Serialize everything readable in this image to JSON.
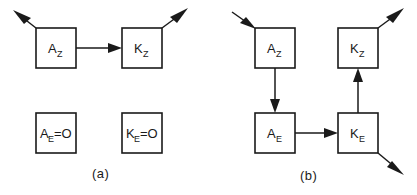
{
  "figure": {
    "type": "block-diagram",
    "panels": [
      {
        "id": "a",
        "caption": "(a)",
        "nodes": [
          {
            "id": "a-az",
            "base": "A",
            "sub": "Z",
            "text": "A",
            "x": 36,
            "y": 28,
            "w": 40,
            "h": 40
          },
          {
            "id": "a-kz",
            "base": "K",
            "sub": "Z",
            "text": "K",
            "x": 122,
            "y": 28,
            "w": 40,
            "h": 40
          },
          {
            "id": "a-ae",
            "base": "A",
            "sub": "E",
            "suffix": "=O",
            "text": "A",
            "x": 36,
            "y": 113,
            "w": 40,
            "h": 40
          },
          {
            "id": "a-ke",
            "base": "K",
            "sub": "E",
            "suffix": " =O",
            "text": "K",
            "x": 122,
            "y": 113,
            "w": 40,
            "h": 40
          }
        ],
        "edges": [
          {
            "id": "a-in-az",
            "from": "external",
            "to": "a-az",
            "kind": "diagonal-up-left"
          },
          {
            "id": "a-az-kz",
            "from": "a-az",
            "to": "a-kz",
            "kind": "horizontal-right"
          },
          {
            "id": "a-kz-out",
            "from": "a-kz",
            "to": "external",
            "kind": "diagonal-up-right"
          }
        ]
      },
      {
        "id": "b",
        "caption": "(b)",
        "nodes": [
          {
            "id": "b-az",
            "base": "A",
            "sub": "Z",
            "text": "A",
            "x": 255,
            "y": 28,
            "w": 40,
            "h": 40
          },
          {
            "id": "b-kz",
            "base": "K",
            "sub": "Z",
            "text": "K",
            "x": 338,
            "y": 28,
            "w": 40,
            "h": 40
          },
          {
            "id": "b-ae",
            "base": "A",
            "sub": "E",
            "text": "A",
            "x": 255,
            "y": 113,
            "w": 40,
            "h": 40
          },
          {
            "id": "b-ke",
            "base": "K",
            "sub": "E",
            "text": "K",
            "x": 338,
            "y": 113,
            "w": 40,
            "h": 40
          }
        ],
        "edges": [
          {
            "id": "b-in-az",
            "from": "external",
            "to": "b-az",
            "kind": "diagonal-down-right"
          },
          {
            "id": "b-az-ae",
            "from": "b-az",
            "to": "b-ae",
            "kind": "vertical-down"
          },
          {
            "id": "b-ae-ke",
            "from": "b-ae",
            "to": "b-ke",
            "kind": "horizontal-right"
          },
          {
            "id": "b-ke-kz",
            "from": "b-ke",
            "to": "b-kz",
            "kind": "vertical-up"
          },
          {
            "id": "b-kz-out",
            "from": "b-kz",
            "to": "external",
            "kind": "diagonal-up-right"
          },
          {
            "id": "b-ke-out",
            "from": "b-ke",
            "to": "external",
            "kind": "diagonal-down-right"
          }
        ]
      }
    ],
    "labels": {
      "a_az": "A",
      "a_az_sub": "Z",
      "a_kz": "K",
      "a_kz_sub": "Z",
      "a_ae": "A",
      "a_ae_sub": "E",
      "a_ae_eq": "=O",
      "a_ke": "K",
      "a_ke_sub": "E",
      "a_ke_eq": "=O",
      "b_az": "A",
      "b_az_sub": "Z",
      "b_kz": "K",
      "b_kz_sub": "Z",
      "b_ae": "A",
      "b_ae_sub": "E",
      "b_ke": "K",
      "b_ke_sub": "E",
      "caption_a": "(a)",
      "caption_b": "(b)"
    },
    "colors": {
      "background": "#ffffff",
      "stroke": "#1a1a1a",
      "fill": "#ffffff",
      "text": "#1a1a1a"
    }
  }
}
